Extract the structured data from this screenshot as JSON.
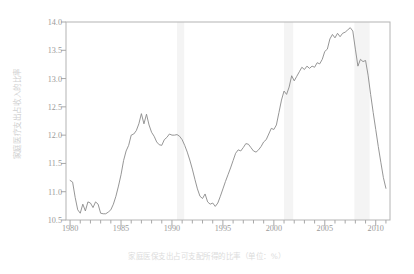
{
  "figure": {
    "y_axis_label": "家庭医疗支出占收入的比率",
    "caption": "家庭医保支出占可支配所得的比率（单位：%）"
  },
  "chart_data": {
    "type": "line",
    "title": "",
    "subtitle": "",
    "xlabel": "家庭医保支出占可支配所得的比率（单位：%）",
    "ylabel": "家庭医疗支出占收入的比率",
    "xlim": [
      1979.6,
      2011.4
    ],
    "ylim": [
      10.5,
      14.0
    ],
    "yticks": [
      10.5,
      11.0,
      11.5,
      12.0,
      12.5,
      13.0,
      13.5,
      14.0
    ],
    "ytick_labels": [
      "10.5",
      "11.0",
      "11.5",
      "12.0",
      "12.5",
      "13.0",
      "13.5",
      "14.0"
    ],
    "xticks": [
      1980,
      1985,
      1990,
      1995,
      2000,
      2005,
      2010
    ],
    "xtick_labels": [
      "1980",
      "1985",
      "1990",
      "1995",
      "2000",
      "2005",
      "2010"
    ],
    "x_minor_tick_interval": 1,
    "grid": false,
    "legend": "none",
    "line_color": "#8a8a8a",
    "band_color": "#f4f4f4",
    "frame_color": "#b4b4b4",
    "tick_color": "#a8a8a8",
    "recession_bands": [
      {
        "start": 1990.5,
        "end": 1991.2
      },
      {
        "start": 2001.0,
        "end": 2001.9
      },
      {
        "start": 2007.9,
        "end": 2009.4
      }
    ],
    "series": [
      {
        "name": "家庭医保支出占可支配所得的比率",
        "x": [
          1980.0,
          1980.25,
          1980.5,
          1980.75,
          1981.0,
          1981.25,
          1981.5,
          1981.75,
          1982.0,
          1982.25,
          1982.5,
          1982.75,
          1983.0,
          1983.25,
          1983.5,
          1983.75,
          1984.0,
          1984.25,
          1984.5,
          1984.75,
          1985.0,
          1985.25,
          1985.5,
          1985.75,
          1986.0,
          1986.25,
          1986.5,
          1986.75,
          1987.0,
          1987.25,
          1987.5,
          1987.75,
          1988.0,
          1988.25,
          1988.5,
          1988.75,
          1989.0,
          1989.25,
          1989.5,
          1989.75,
          1990.0,
          1990.25,
          1990.5,
          1990.75,
          1991.0,
          1991.25,
          1991.5,
          1991.75,
          1992.0,
          1992.25,
          1992.5,
          1992.75,
          1993.0,
          1993.25,
          1993.5,
          1993.75,
          1994.0,
          1994.25,
          1994.5,
          1994.75,
          1995.0,
          1995.25,
          1995.5,
          1995.75,
          1996.0,
          1996.25,
          1996.5,
          1996.75,
          1997.0,
          1997.25,
          1997.5,
          1997.75,
          1998.0,
          1998.25,
          1998.5,
          1998.75,
          1999.0,
          1999.25,
          1999.5,
          1999.75,
          2000.0,
          2000.25,
          2000.5,
          2000.75,
          2001.0,
          2001.25,
          2001.5,
          2001.75,
          2002.0,
          2002.25,
          2002.5,
          2002.75,
          2003.0,
          2003.25,
          2003.5,
          2003.75,
          2004.0,
          2004.25,
          2004.5,
          2004.75,
          2005.0,
          2005.25,
          2005.5,
          2005.75,
          2006.0,
          2006.25,
          2006.5,
          2006.75,
          2007.0,
          2007.25,
          2007.5,
          2007.75,
          2008.0,
          2008.25,
          2008.5,
          2008.75,
          2009.0,
          2009.25,
          2009.5,
          2009.75,
          2010.0,
          2010.25,
          2010.5,
          2010.75,
          2011.0
        ],
        "y": [
          11.2,
          11.17,
          10.9,
          10.68,
          10.62,
          10.78,
          10.66,
          10.82,
          10.8,
          10.72,
          10.82,
          10.78,
          10.62,
          10.61,
          10.61,
          10.64,
          10.68,
          10.78,
          10.92,
          11.1,
          11.3,
          11.55,
          11.72,
          11.82,
          12.0,
          12.02,
          12.08,
          12.2,
          12.38,
          12.2,
          12.37,
          12.18,
          12.05,
          11.98,
          11.88,
          11.83,
          11.82,
          11.92,
          11.96,
          12.02,
          12.0,
          12.0,
          12.01,
          11.98,
          11.92,
          11.82,
          11.7,
          11.56,
          11.4,
          11.22,
          11.05,
          10.92,
          10.88,
          10.96,
          10.82,
          10.78,
          10.8,
          10.74,
          10.8,
          10.92,
          11.05,
          11.18,
          11.3,
          11.42,
          11.55,
          11.68,
          11.74,
          11.72,
          11.78,
          11.85,
          11.84,
          11.78,
          11.72,
          11.7,
          11.74,
          11.8,
          11.88,
          11.92,
          12.02,
          12.12,
          12.1,
          12.18,
          12.4,
          12.62,
          12.78,
          12.72,
          12.85,
          13.05,
          12.96,
          13.04,
          13.12,
          13.2,
          13.16,
          13.22,
          13.18,
          13.22,
          13.2,
          13.28,
          13.26,
          13.34,
          13.48,
          13.52,
          13.7,
          13.78,
          13.72,
          13.8,
          13.74,
          13.8,
          13.82,
          13.86,
          13.9,
          13.84,
          13.52,
          13.22,
          13.34,
          13.3,
          13.32,
          13.06,
          12.72,
          12.4,
          12.1,
          11.8,
          11.52,
          11.25,
          11.06
        ]
      }
    ]
  }
}
